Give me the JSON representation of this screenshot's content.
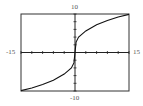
{
  "chart_data": {
    "type": "line",
    "title": "",
    "xlabel": "",
    "ylabel": "",
    "xlim": [
      -15,
      15
    ],
    "ylim": [
      -10,
      10
    ],
    "grid": false,
    "legend": null,
    "x_tick_step": 3,
    "y_tick_step": 2,
    "window_labels": {
      "xmin": "-15",
      "xmax": "15",
      "ymin": "-10",
      "ymax": "10"
    },
    "series": [
      {
        "name": "f(x)",
        "description": "cube-root-like curve through origin with vertical tangent at x=0",
        "x": [
          -15,
          -12,
          -9,
          -6,
          -3,
          -1,
          -0.3,
          0,
          0.3,
          1,
          3,
          6,
          9,
          12,
          15
        ],
        "y": [
          -9.9,
          -9.2,
          -8.3,
          -7.2,
          -5.6,
          -4.0,
          -2.7,
          0,
          2.7,
          4.0,
          5.6,
          7.2,
          8.3,
          9.2,
          9.9
        ]
      }
    ]
  },
  "colors": {
    "axis": "#222222",
    "frame": "#333333",
    "curve": "#111111",
    "label": "#555555"
  }
}
